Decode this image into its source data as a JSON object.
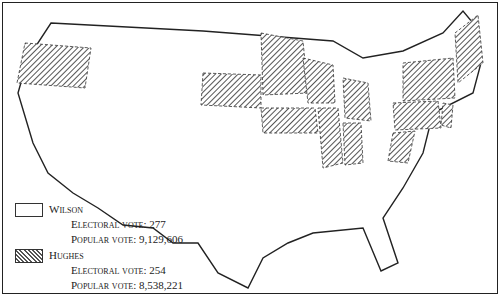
{
  "map": {
    "title": "1916 U.S. Presidential Election",
    "legend": [
      {
        "candidate": "Wilson",
        "pattern": "blank",
        "electoral_label": "Electoral vote: 277",
        "popular_label": "Popular vote: 9,129,606"
      },
      {
        "candidate": "Hughes",
        "pattern": "hatched",
        "electoral_label": "Electoral vote: 254",
        "popular_label": "Popular vote: 8,538,221"
      }
    ],
    "hughes_states": [
      "Oregon",
      "South Dakota",
      "Minnesota",
      "Wisconsin",
      "Iowa",
      "Illinois",
      "Michigan",
      "Indiana",
      "West Virginia",
      "Pennsylvania",
      "New York",
      "New Jersey",
      "Delaware",
      "Vermont",
      "Maine",
      "Connecticut",
      "Massachusetts",
      "Rhode Island"
    ],
    "colors": {
      "line": "#222222",
      "hatch": "#555555",
      "background": "#ffffff"
    }
  }
}
